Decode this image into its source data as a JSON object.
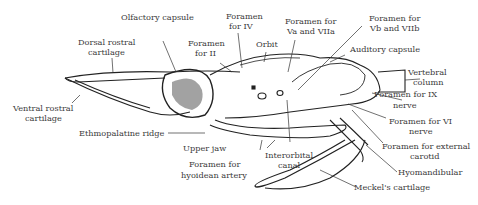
{
  "figure": {
    "labels": {
      "olfactory_capsule": "Olfactory capsule",
      "foramen_iv_1": "Foramen",
      "foramen_iv_2": "for IV",
      "foramen_va_1": "Foramen for",
      "foramen_va_2": "Va and VIIa",
      "foramen_vb_1": "Foramen for",
      "foramen_vb_2": "Vb and VIIb",
      "dorsal_rostral_1": "Dorsal rostral",
      "dorsal_rostral_2": "cartilage",
      "foramen_ii_1": "Foramen",
      "foramen_ii_2": "for II",
      "orbit": "Orbit",
      "auditory_capsule": "Auditory capsule",
      "vertebral_1": "Vertebral",
      "vertebral_2": "column",
      "foramen_ix_1": "Foramen for IX",
      "foramen_ix_2": "nerve",
      "ventral_rostral_1": "Ventral rostral",
      "ventral_rostral_2": "cartilage",
      "foramen_vi_1": "Foramen for VI",
      "foramen_vi_2": "nerve",
      "ethmopalatine": "Ethmopalatine ridge",
      "upper_jaw": "Upper jaw",
      "foramen_ext_carotid_1": "Foramen for external",
      "foramen_ext_carotid_2": "carotid",
      "foramen_hyoidean_1": "Foramen for",
      "foramen_hyoidean_2": "hyoidean artery",
      "interorbital_1": "Interorbital",
      "interorbital_2": "canal",
      "hyomandibular": "Hyomandibular",
      "meckels": "Meckel's cartilage"
    }
  }
}
